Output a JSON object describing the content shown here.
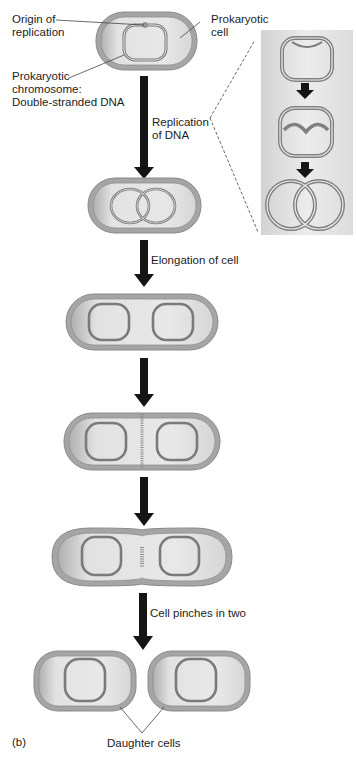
{
  "figure": {
    "panel_label": "(b)",
    "colors": {
      "cell_outer": "#9a9a9a",
      "cell_fill": "#cfcfcf",
      "cytoplasm_light": "#ececec",
      "dna_ring": "#7d7d7d",
      "arrow": "#151515",
      "inset_bg": "#e3e3e3",
      "dashed_leader": "#555555"
    }
  },
  "labels": {
    "origin_of_replication": [
      "Origin of",
      "replication"
    ],
    "prokaryotic_cell": [
      "Prokaryotic",
      "cell"
    ],
    "prokaryotic_chromosome": [
      "Prokaryotic",
      "chromosome:",
      "Double-stranded DNA"
    ],
    "replication_of_dna": [
      "Replication",
      "of DNA"
    ],
    "elongation_of_cell": "Elongation of cell",
    "cell_pinches_in_two": "Cell pinches in two",
    "daughter_cells": "Daughter cells"
  },
  "stages": [
    {
      "id": "initial-cell",
      "description": "Cell with single circular chromosome"
    },
    {
      "id": "replicated-dna",
      "description": "Two overlapping chromosomes after DNA replication"
    },
    {
      "id": "elongated-cell",
      "description": "Elongated cell with separated chromosomes"
    },
    {
      "id": "septum-forming",
      "description": "Septum forming at cell midline"
    },
    {
      "id": "pinching-cell",
      "description": "Cell constricting at the middle"
    },
    {
      "id": "daughter-cells",
      "description": "Two separate daughter cells"
    }
  ],
  "inset": {
    "title": "DNA replication detail",
    "steps": [
      "Replication begins at origin",
      "Replication forks move around ring",
      "Two interlocked chromosomes"
    ]
  }
}
